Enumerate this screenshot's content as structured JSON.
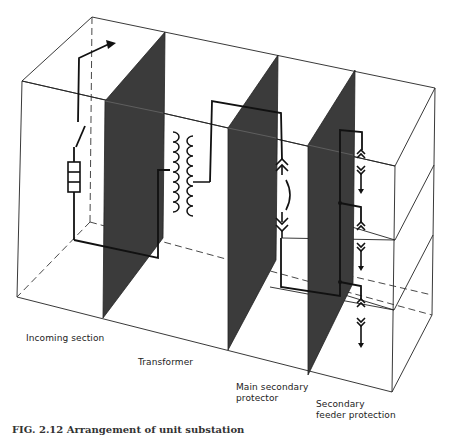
{
  "figure": {
    "type": "isometric switchgear compartment diagram",
    "colors": {
      "panel": "#3a3a3a",
      "line": "#111111",
      "background": "#ffffff"
    },
    "sections": [
      {
        "id": "incoming",
        "label": "Incoming section"
      },
      {
        "id": "transformer",
        "label": "Transformer"
      },
      {
        "id": "main_secondary",
        "label_line1": "Main secondary",
        "label_line2": "protector"
      },
      {
        "id": "feeder",
        "label_line1": "Secondary",
        "label_line2": "feeder protection"
      }
    ],
    "components": [
      "cable-termination",
      "disconnect-switch",
      "fuse",
      "transformer-windings",
      "withdrawable-breaker-contacts",
      "feeder-plug-in-contacts"
    ],
    "caption": "FIG. 2.12  Arrangement of unit substation"
  }
}
